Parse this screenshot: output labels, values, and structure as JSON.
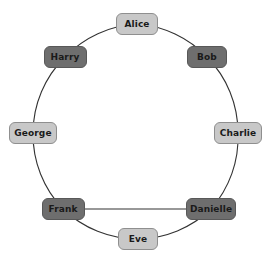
{
  "diagram": {
    "type": "node-link-graph",
    "shape": "ring",
    "title": "",
    "background_color": "#ffffff",
    "colors": {
      "light_fill": "#c8c8c8",
      "light_border": "#8f8f8f",
      "dark_fill": "#6e6e6e",
      "dark_border": "#585858",
      "edge": "#333333",
      "label": "#1a1a1a"
    },
    "nodes": [
      {
        "id": "alice",
        "label": "Alice",
        "shade": "light",
        "x": 137,
        "y": 24,
        "width": 42,
        "height": 22
      },
      {
        "id": "bob",
        "label": "Bob",
        "shade": "dark",
        "x": 207,
        "y": 57,
        "width": 40,
        "height": 22
      },
      {
        "id": "charlie",
        "label": "Charlie",
        "shade": "light",
        "x": 238,
        "y": 133,
        "width": 48,
        "height": 22
      },
      {
        "id": "danielle",
        "label": "Danielle",
        "shade": "dark",
        "x": 211,
        "y": 209,
        "width": 50,
        "height": 22
      },
      {
        "id": "eve",
        "label": "Eve",
        "shade": "light",
        "x": 138,
        "y": 239,
        "width": 40,
        "height": 22
      },
      {
        "id": "frank",
        "label": "Frank",
        "shade": "dark",
        "x": 63,
        "y": 209,
        "width": 43,
        "height": 22
      },
      {
        "id": "george",
        "label": "George",
        "shade": "light",
        "x": 33,
        "y": 133,
        "width": 48,
        "height": 22
      },
      {
        "id": "harry",
        "label": "Harry",
        "shade": "dark",
        "x": 65,
        "y": 57,
        "width": 43,
        "height": 22
      }
    ],
    "edges": [
      {
        "id": "alice-bob",
        "source": "alice",
        "target": "bob",
        "style": "arc"
      },
      {
        "id": "bob-charlie",
        "source": "bob",
        "target": "charlie",
        "style": "arc"
      },
      {
        "id": "charlie-danielle",
        "source": "charlie",
        "target": "danielle",
        "style": "arc"
      },
      {
        "id": "danielle-eve",
        "source": "danielle",
        "target": "eve",
        "style": "arc"
      },
      {
        "id": "eve-frank",
        "source": "eve",
        "target": "frank",
        "style": "arc"
      },
      {
        "id": "frank-george",
        "source": "frank",
        "target": "george",
        "style": "arc"
      },
      {
        "id": "george-harry",
        "source": "george",
        "target": "harry",
        "style": "arc"
      },
      {
        "id": "harry-alice",
        "source": "harry",
        "target": "alice",
        "style": "arc"
      },
      {
        "id": "frank-danielle",
        "source": "frank",
        "target": "danielle",
        "style": "straight"
      }
    ],
    "geometry": {
      "center_x": 137,
      "center_y": 132,
      "radius": 108
    }
  }
}
